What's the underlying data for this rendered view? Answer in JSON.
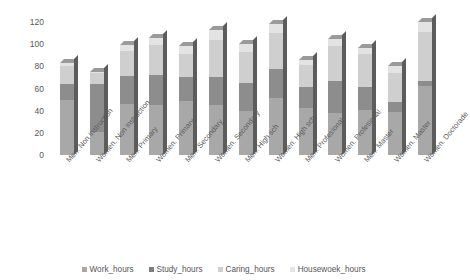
{
  "chart_data": {
    "type": "bar",
    "subtype": "stacked-column-3d",
    "title": "",
    "subtitle": "",
    "xlabel": "",
    "ylabel": "",
    "ylim": [
      0,
      120
    ],
    "yticks": [
      0,
      20,
      40,
      60,
      80,
      100,
      120
    ],
    "ytick_labels": [
      "0",
      "20",
      "40",
      "60",
      "80",
      "100",
      "120"
    ],
    "grid": false,
    "legend_position": "bottom",
    "stacked": true,
    "categories": [
      "Men. Non instruction",
      "Women. Non instruction",
      "Men. Primary",
      "Women. Primary",
      "Men. Secondary",
      "Women. Secondary",
      "Men. High sch",
      "Women. High sch",
      "Men. Profesional",
      "Women. Profesional",
      "Men. Master",
      "Women. Master",
      "Women. Doctorade"
    ],
    "series": [
      {
        "name": "Work_hours",
        "color": "#a8a8a8",
        "values": [
          50,
          21,
          46,
          45,
          49,
          45,
          40,
          51,
          42,
          38,
          41,
          39,
          62
        ]
      },
      {
        "name": "Study_hours",
        "color": "#8d8d8d",
        "values": [
          14,
          43,
          25,
          27,
          21,
          25,
          25,
          27,
          19,
          29,
          20,
          9,
          5
        ]
      },
      {
        "name": "Caring_hours",
        "color": "#cfcfcf",
        "values": [
          16,
          10,
          23,
          27,
          21,
          34,
          28,
          32,
          20,
          31,
          30,
          26,
          44
        ]
      },
      {
        "name": "Housewoek_hours",
        "color": "#e3e3e3",
        "values": [
          3,
          1,
          5,
          7,
          7,
          9,
          7,
          8,
          5,
          7,
          6,
          6,
          9
        ]
      }
    ],
    "totals": [
      83,
      75,
      99,
      106,
      98,
      113,
      100,
      118,
      86,
      105,
      97,
      80,
      120
    ]
  }
}
